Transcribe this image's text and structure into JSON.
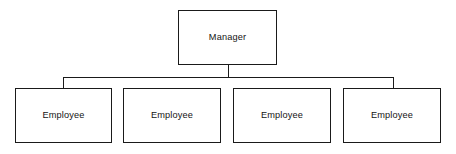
{
  "diagram": {
    "type": "organizational-chart",
    "background_color": "#ffffff",
    "line_color": "#1a1a1a",
    "text_color": "#141414",
    "root": {
      "label": "Manager"
    },
    "children": [
      {
        "label": "Employee"
      },
      {
        "label": "Employee"
      },
      {
        "label": "Employee"
      },
      {
        "label": "Employee"
      }
    ]
  }
}
